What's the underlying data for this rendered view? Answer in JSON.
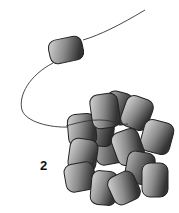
{
  "figure": {
    "panel_label": "2",
    "colors": {
      "background": "#ffffff",
      "strand": "#333333",
      "bead_light": "#d8d8d8",
      "bead_dark": "#3a3a3a",
      "bead_outline": "#222222"
    }
  }
}
